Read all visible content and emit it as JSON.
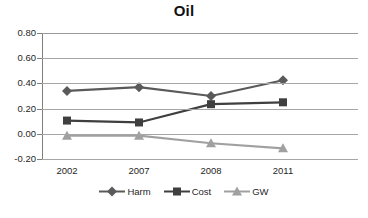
{
  "chart_data": {
    "type": "line",
    "title": "Oil",
    "xlabel": "",
    "ylabel": "",
    "categories": [
      "2002",
      "2007",
      "2008",
      "2011"
    ],
    "ylim": [
      -0.2,
      0.8
    ],
    "yticks": [
      0.8,
      0.6,
      0.4,
      0.2,
      0.0,
      -0.2
    ],
    "ytick_labels": [
      "0.80",
      "0.60",
      "0.40",
      "0.20",
      "0.00",
      "-0.20"
    ],
    "grid": true,
    "legend_position": "bottom",
    "series": [
      {
        "name": "Harm",
        "marker": "diamond",
        "color": "#5a5a5a",
        "values": [
          0.34,
          0.37,
          0.3,
          0.425
        ]
      },
      {
        "name": "Cost",
        "marker": "square",
        "color": "#3f3f3f",
        "values": [
          0.105,
          0.09,
          0.235,
          0.25
        ]
      },
      {
        "name": "GW",
        "marker": "triangle",
        "color": "#a0a0a0",
        "values": [
          -0.015,
          -0.015,
          -0.075,
          -0.115
        ]
      }
    ]
  },
  "colors": {
    "harm": "#5a5a5a",
    "cost": "#3f3f3f",
    "gw": "#a0a0a0",
    "gridline": "#a6a6a6",
    "axis": "#7f7f7f",
    "text": "#1f1f1f",
    "background": "#ffffff"
  }
}
